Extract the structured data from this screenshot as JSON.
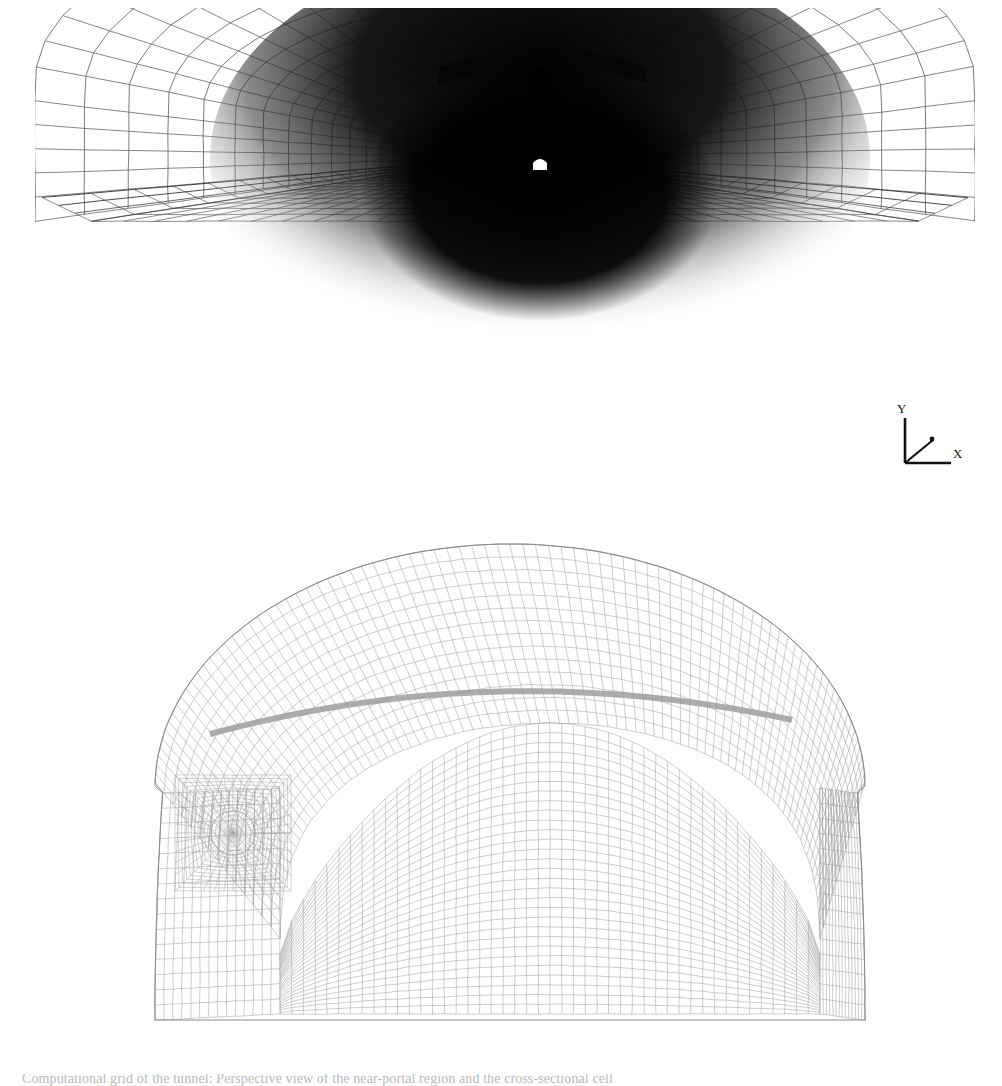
{
  "figure": {
    "domain": "scientific-figure",
    "kind": "cfd-computational-mesh",
    "background_color": "#ffffff",
    "panel_count": 2,
    "caption_partial": "Computational grid of the tunnel: Perspective view of the near-portal region and the cross-sectional cell"
  },
  "perspective_view": {
    "name": "Perspective view of tunnel mesh",
    "description": "Interior perspective looking down the tunnel axis toward the far portal",
    "mesh_color": "#4a4a4a",
    "far_field_color": "#0a0a0a",
    "floor_color": "#6e6e6e",
    "vanishing_point": {
      "x": 505,
      "y": 157
    },
    "portal_light": {
      "label": "far portal opening",
      "color": "#ffffff",
      "x": 505,
      "y": 156,
      "width": 15,
      "height": 11
    },
    "features": [
      "roof-dome-mesh",
      "sidewall-mesh",
      "roadway-floor-mesh",
      "left-walkway-kerb",
      "right-walkway-kerb",
      "suspended-ceiling-arch"
    ],
    "axis_triad": {
      "name": "coordinate-axis-triad",
      "origin": {
        "x": 905,
        "y": 470
      },
      "axes": [
        {
          "label": "Y",
          "direction": "up"
        },
        {
          "label": "X",
          "direction": "right"
        },
        {
          "label": "Z",
          "direction": "into-page"
        }
      ],
      "color": "#111111"
    },
    "grid": {
      "axial_stations": 46,
      "circumferential_lines": 34,
      "floor_transverse_lines": 40,
      "floor_longitudinal_lines": 26
    }
  },
  "cross_section_view": {
    "name": "Cross-sectional mesh of tunnel",
    "description": "Horseshoe / arch tunnel profile meshed with a structured multi-block grid",
    "mesh_color": "#8c8c8c",
    "outline_color": "#9a9a9a",
    "profile": {
      "type": "arch-horseshoe",
      "left_x": 25,
      "right_x": 735,
      "crown_y": 6,
      "invert_y": 482,
      "springline_y": 250
    },
    "jet_fan": {
      "name": "jet-fan-ogrid",
      "center_x": 103,
      "center_y": 295,
      "radius": 22,
      "ogrid_half_size": 58,
      "label": "circular jet fan with O-grid refinement"
    },
    "false_ceiling": {
      "name": "suspended-ceiling-duct",
      "color": "#9e9e9e",
      "left_x": 80,
      "right_x": 660,
      "apex_y": 140,
      "thickness": 7
    },
    "inner_boundary": {
      "name": "traffic-space-boundary",
      "left_x": 150,
      "right_x": 690,
      "top_y": 185
    },
    "grid": {
      "radial_cells": 34,
      "circumferential_cells": 62,
      "boundary_layer_bands": 6
    }
  }
}
